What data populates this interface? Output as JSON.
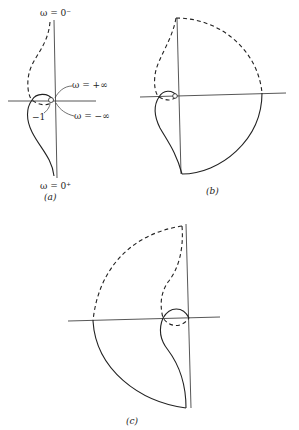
{
  "figure": {
    "panels": [
      {
        "id": "a",
        "caption": "(a)",
        "labels": {
          "omega_zero_minus": "ω = 0⁻",
          "omega_zero_plus": "ω = 0⁺",
          "omega_plus_inf": "ω = +∞",
          "omega_minus_inf": "ω = −∞",
          "critical_point": "−1"
        }
      },
      {
        "id": "b",
        "caption": "(b)"
      },
      {
        "id": "c",
        "caption": "(c)"
      }
    ]
  }
}
